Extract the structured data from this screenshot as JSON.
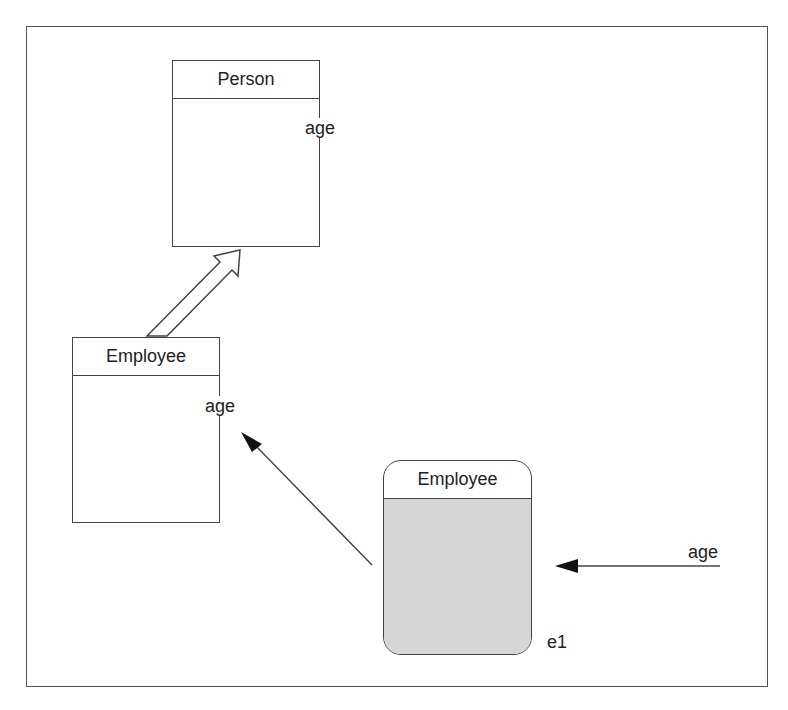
{
  "diagram": {
    "classes": [
      {
        "id": "person",
        "name": "Person",
        "attribute": "age"
      },
      {
        "id": "employee",
        "name": "Employee",
        "attribute": "age"
      }
    ],
    "instance": {
      "class_name": "Employee",
      "object_name": "e1"
    },
    "incoming_message": {
      "label": "age"
    },
    "relations": [
      {
        "from": "Employee",
        "to": "Person",
        "type": "inheritance"
      },
      {
        "from": "e1",
        "to": "Employee",
        "type": "instance-of"
      },
      {
        "from": "age",
        "to": "e1",
        "type": "message"
      }
    ],
    "colors": {
      "stroke": "#444444",
      "instance_fill": "#d6d6d6"
    }
  }
}
